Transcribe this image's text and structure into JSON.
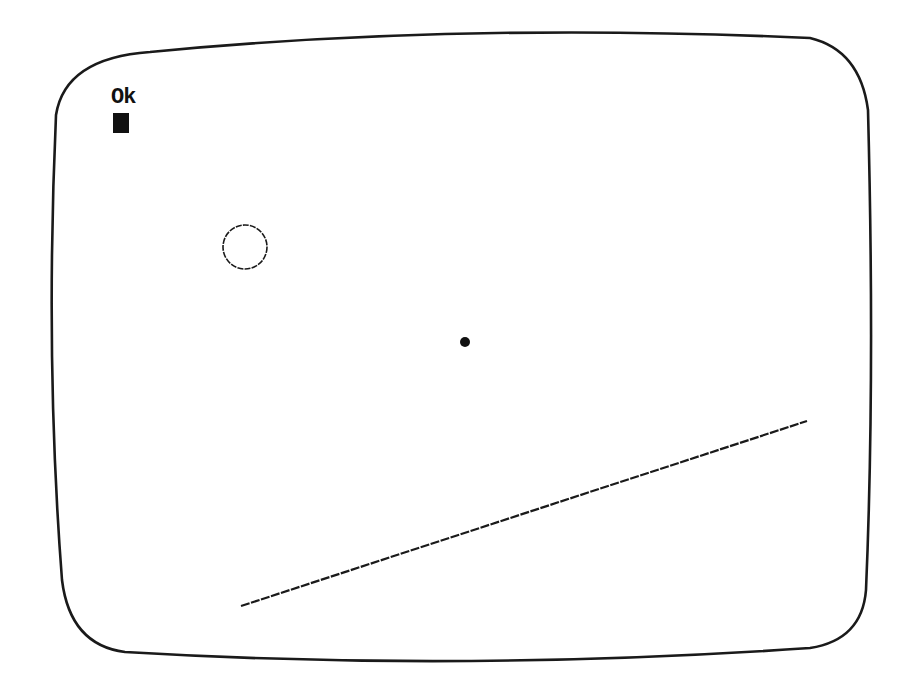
{
  "screen": {
    "prompt": "Ok",
    "colors": {
      "background": "#ffffff",
      "ink": "#111111"
    }
  },
  "shapes": {
    "circle": {
      "cx": 245,
      "cy": 247,
      "r": 22
    },
    "point": {
      "cx": 465,
      "cy": 342,
      "r": 5
    },
    "line": {
      "x1": 241,
      "y1": 606,
      "x2": 807,
      "y2": 421
    }
  }
}
